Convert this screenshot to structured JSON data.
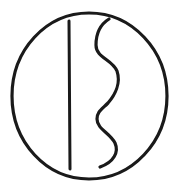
{
  "figure": {
    "type": "line-drawing",
    "caption": "",
    "canvas": {
      "width": 183,
      "height": 188,
      "background_color": "#ffffff"
    },
    "ink_color": "#1a1a1a",
    "elements": [
      {
        "name": "enclosing-circle",
        "kind": "circle",
        "center_x": 89,
        "center_y": 96,
        "radius_x": 77,
        "radius_y": 83,
        "stroke_width": 3.2,
        "closed": true,
        "path": "M 89 13 C 46 13 12 50 12 96 C 12 142 46 179 89 179 C 132 179 167 142 167 96 C 167 50 132 13 89 13 Z"
      },
      {
        "name": "straight-vertical-stroke",
        "kind": "line",
        "x1": 69,
        "y1": 21,
        "x2": 70,
        "y2": 169,
        "stroke_width": 3.0,
        "closed": false,
        "path": "M 69 21 L 70 169"
      },
      {
        "name": "wavy-s-stroke",
        "kind": "curve",
        "start_x": 109,
        "start_y": 19,
        "end_x": 100,
        "end_y": 167,
        "stroke_width": 3.2,
        "closed": false,
        "inflections": [
          {
            "x": 97,
            "y": 45
          },
          {
            "x": 118,
            "y": 72
          },
          {
            "x": 98,
            "y": 116
          },
          {
            "x": 116,
            "y": 150
          }
        ],
        "path": "M 109 19 C 101 24 96 33 96 45 C 96 58 112 59 117 71 C 121 83 115 95 108 103 C 101 110 97 112 97 119 C 97 129 110 133 115 143 C 119 152 114 162 100 167"
      }
    ]
  }
}
